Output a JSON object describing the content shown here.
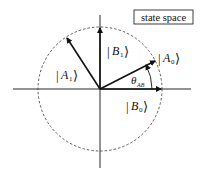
{
  "diagram": {
    "title_box": "state space",
    "vectors": [
      {
        "name": "A0",
        "label": "A",
        "sub": "0",
        "angle_deg": 28
      },
      {
        "name": "A1",
        "label": "A",
        "sub": "1",
        "angle_deg": 118
      },
      {
        "name": "B0",
        "label": "B",
        "sub": "0",
        "angle_deg": 0
      },
      {
        "name": "B1",
        "label": "B",
        "sub": "1",
        "angle_deg": 90
      }
    ],
    "angle_label": {
      "symbol": "θ",
      "sub": "AB"
    },
    "circle": {
      "style": "dashed",
      "role": "unit circle"
    },
    "colors": {
      "stroke": "#111111",
      "background": "#ffffff"
    }
  }
}
